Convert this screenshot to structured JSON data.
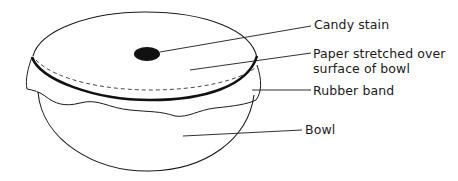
{
  "diagram": {
    "labels": {
      "candy_stain": "Candy stain",
      "paper_line1": "Paper stretched over",
      "paper_line2": "surface of bowl",
      "rubber_band": "Rubber band",
      "bowl": "Bowl"
    },
    "colors": {
      "line": "#1a1a1a",
      "stain": "#111111",
      "background": "#ffffff"
    }
  }
}
